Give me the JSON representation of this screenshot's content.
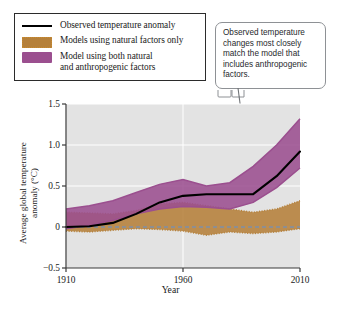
{
  "legend": {
    "items": [
      {
        "key": "observed",
        "label": "Observed temperature anomaly",
        "style": "line",
        "color": "#000000"
      },
      {
        "key": "natural",
        "label": "Models using natural factors only",
        "style": "band",
        "color": "#b5803a"
      },
      {
        "key": "both",
        "label": "Model using both natural\nand anthropogenic factors",
        "style": "band",
        "color": "#9b4f8f"
      }
    ]
  },
  "callout": {
    "text": "Observed temperature changes most closely match the model that includes anthropogenic factors.",
    "points_to_year": 1995,
    "border_color": "#8e9195"
  },
  "chart_data": {
    "type": "area",
    "title": "",
    "xlabel": "Year",
    "ylabel": "Average global temperature\nanomaly (°C)",
    "xlim": [
      1910,
      2010
    ],
    "ylim": [
      -0.5,
      1.5
    ],
    "xticks": [
      1910,
      1960,
      2010
    ],
    "xticklabels": [
      "1910",
      "1960",
      "2010"
    ],
    "yticks": [
      -0.5,
      0,
      0.5,
      1.0,
      1.5
    ],
    "yticklabels": [
      "−0.5",
      "0",
      "0.5",
      "1.0",
      "1.5"
    ],
    "grid": true,
    "grid_color": "#ffffff",
    "plot_background": "#e3e3e3",
    "zero_line": {
      "value": 0,
      "style": "dashed",
      "color": "#7e8fa6"
    },
    "legend_position": "above-left",
    "x": [
      1910,
      1920,
      1930,
      1940,
      1950,
      1960,
      1970,
      1980,
      1990,
      2000,
      2010
    ],
    "series": [
      {
        "name": "Models using natural factors only",
        "type": "band",
        "color": "#b5803a",
        "edge_style": "dotted",
        "lower": [
          -0.05,
          -0.06,
          -0.04,
          -0.02,
          -0.03,
          -0.05,
          -0.1,
          -0.06,
          -0.08,
          -0.06,
          -0.02
        ],
        "upper": [
          0.18,
          0.17,
          0.16,
          0.2,
          0.28,
          0.3,
          0.26,
          0.22,
          0.18,
          0.22,
          0.32
        ]
      },
      {
        "name": "Model using both natural and anthropogenic factors",
        "type": "band",
        "color": "#9b4f8f",
        "edge_style": "solid",
        "lower": [
          -0.02,
          0.02,
          0.08,
          0.16,
          0.22,
          0.25,
          0.24,
          0.22,
          0.3,
          0.48,
          0.72
        ],
        "upper": [
          0.22,
          0.26,
          0.32,
          0.42,
          0.52,
          0.58,
          0.5,
          0.54,
          0.74,
          1.0,
          1.32
        ]
      },
      {
        "name": "Observed temperature anomaly",
        "type": "line",
        "color": "#000000",
        "values": [
          0.0,
          0.01,
          0.05,
          0.16,
          0.3,
          0.38,
          0.4,
          0.4,
          0.4,
          0.62,
          0.92
        ]
      }
    ]
  }
}
